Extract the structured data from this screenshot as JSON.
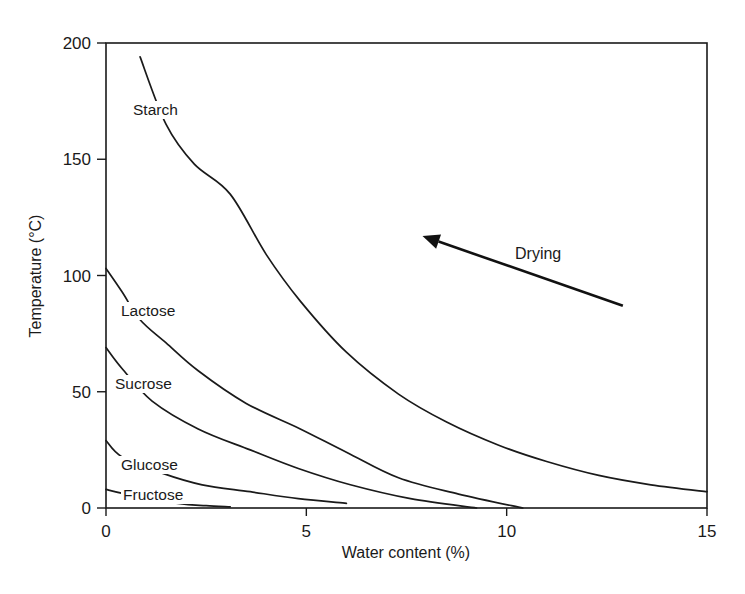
{
  "chart_data": {
    "type": "line",
    "title": "",
    "xlabel": "Water content (%)",
    "ylabel": "Temperature (°C)",
    "xlim": [
      0,
      15
    ],
    "ylim": [
      0,
      200
    ],
    "xticks": [
      0,
      5,
      10,
      15
    ],
    "yticks": [
      0,
      50,
      100,
      150,
      200
    ],
    "grid": false,
    "legend": "inline labels",
    "series": [
      {
        "name": "Starch",
        "x": [
          0.85,
          1.5,
          2.2,
          3.1,
          4.0,
          4.85,
          6.0,
          7.3,
          8.5,
          9.8,
          11.0,
          12.3,
          13.6,
          15.0
        ],
        "y": [
          194,
          165,
          148,
          135,
          109,
          89,
          67,
          49,
          37,
          27,
          20,
          14,
          10,
          7
        ]
      },
      {
        "name": "Lactose",
        "x": [
          0,
          0.4,
          0.85,
          1.5,
          2.3,
          3.5,
          4.85,
          6.0,
          7.3,
          8.8,
          10.4
        ],
        "y": [
          103,
          93,
          81,
          71,
          59,
          45,
          34,
          24,
          13,
          6,
          0
        ]
      },
      {
        "name": "Sucrose",
        "x": [
          0,
          0.4,
          1.15,
          2.3,
          3.6,
          4.8,
          6.1,
          7.6,
          9.25
        ],
        "y": [
          69,
          60,
          46,
          34,
          25,
          17,
          10,
          4,
          0
        ]
      },
      {
        "name": "Glucose",
        "x": [
          0,
          0.4,
          1.4,
          2.4,
          3.6,
          4.8,
          6.0
        ],
        "y": [
          29,
          22,
          15,
          10,
          7,
          4,
          2
        ]
      },
      {
        "name": "Fructose",
        "x": [
          0,
          0.5,
          1.8,
          2.5,
          3.1
        ],
        "y": [
          8,
          6,
          2,
          1,
          0.5
        ]
      }
    ],
    "annotations": [
      {
        "text": "Drying",
        "type": "arrow",
        "from": [
          12.9,
          87
        ],
        "to": [
          7.9,
          117
        ]
      }
    ]
  }
}
